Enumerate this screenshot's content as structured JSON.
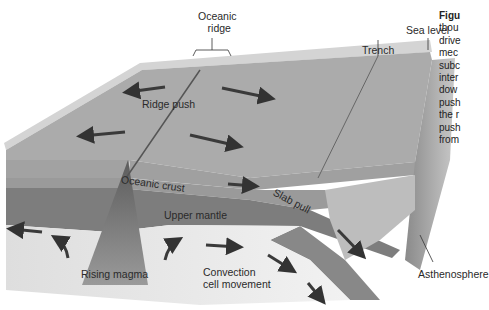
{
  "figure": {
    "caption_lines": [
      "Figu",
      "thou",
      "drive",
      "mec",
      "subc",
      "inter",
      "dow",
      "push",
      "the r",
      "push",
      "from"
    ],
    "caption_bold_word": "Figu"
  },
  "labels": {
    "oceanic_ridge_line1": "Oceanic",
    "oceanic_ridge_line2": "ridge",
    "trench": "Trench",
    "sea_level": "Sea level",
    "ridge_push": "Ridge push",
    "oceanic_crust": "Oceanic crust",
    "slab_pull": "Slab pull",
    "upper_mantle": "Upper mantle",
    "rising_magma": "Rising magma",
    "convection_line1": "Convection",
    "convection_line2": "cell movement",
    "asthenosphere": "Asthenosphere"
  },
  "colors": {
    "sea_surface": "#d8d8d8",
    "seafloor": "#a9a9a9",
    "crust_layer": "#9b9b9b",
    "upper_mantle": "#7f7f7f",
    "asthenosphere": "#e6e6e6",
    "magma": "#6a6a6a",
    "arrow": "#3a3a3a"
  }
}
